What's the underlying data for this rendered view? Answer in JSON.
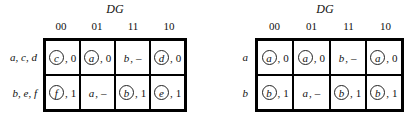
{
  "maps": [
    {
      "var_label": "DG",
      "columns": [
        "00",
        "01",
        "11",
        "10"
      ],
      "rows": [
        {
          "label": "a, c, d",
          "cells": [
            {
              "state": "c",
              "circled": true,
              "output": "0"
            },
            {
              "state": "a",
              "circled": true,
              "output": "0"
            },
            {
              "state": "b",
              "circled": false,
              "output": "–"
            },
            {
              "state": "d",
              "circled": true,
              "output": "0"
            }
          ]
        },
        {
          "label": "b, e, f",
          "cells": [
            {
              "state": "f",
              "circled": true,
              "output": "1"
            },
            {
              "state": "a",
              "circled": false,
              "output": "–"
            },
            {
              "state": "b",
              "circled": true,
              "output": "1"
            },
            {
              "state": "e",
              "circled": true,
              "output": "1"
            }
          ]
        }
      ]
    },
    {
      "var_label": "DG",
      "columns": [
        "00",
        "01",
        "11",
        "10"
      ],
      "rows": [
        {
          "label": "a",
          "cells": [
            {
              "state": "a",
              "circled": true,
              "output": "0"
            },
            {
              "state": "a",
              "circled": true,
              "output": "0"
            },
            {
              "state": "b",
              "circled": false,
              "output": "–"
            },
            {
              "state": "a",
              "circled": true,
              "output": "0"
            }
          ]
        },
        {
          "label": "b",
          "cells": [
            {
              "state": "b",
              "circled": true,
              "output": "1"
            },
            {
              "state": "a",
              "circled": false,
              "output": "–"
            },
            {
              "state": "b",
              "circled": true,
              "output": "1"
            },
            {
              "state": "b",
              "circled": true,
              "output": "1"
            }
          ]
        }
      ]
    }
  ]
}
